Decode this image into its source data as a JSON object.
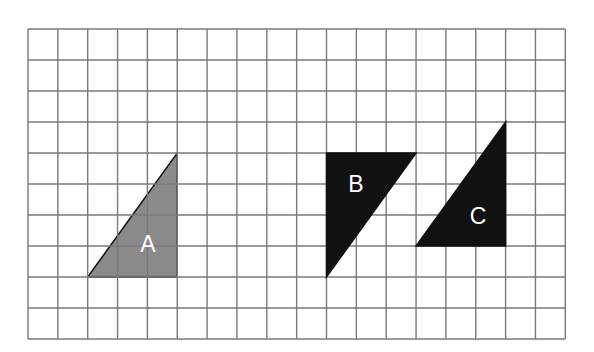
{
  "grid": {
    "columns": 18,
    "rows": 10,
    "origin_x": 28,
    "origin_y": 29,
    "cell_width": 29.85,
    "cell_height": 31,
    "line_color": "#7a7a7a"
  },
  "shapes": [
    {
      "id": "A",
      "label": "A",
      "type": "right-triangle",
      "fill": "#8a8a8a",
      "vertices_grid": [
        [
          2,
          8
        ],
        [
          5,
          4
        ],
        [
          5,
          8
        ]
      ],
      "label_pos": [
        148,
        244
      ]
    },
    {
      "id": "B",
      "label": "B",
      "type": "right-triangle",
      "fill": "#111111",
      "vertices_grid": [
        [
          10,
          4
        ],
        [
          13,
          4
        ],
        [
          10,
          8
        ]
      ],
      "label_pos": [
        356,
        184
      ]
    },
    {
      "id": "C",
      "label": "C",
      "type": "right-triangle",
      "fill": "#111111",
      "vertices_grid": [
        [
          13,
          7
        ],
        [
          16,
          3
        ],
        [
          16,
          7
        ]
      ],
      "label_pos": [
        478,
        216
      ]
    }
  ]
}
